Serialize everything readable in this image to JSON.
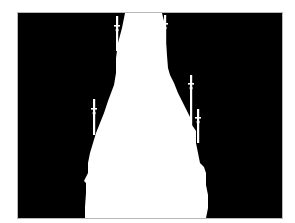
{
  "image": {
    "kind": "binary-segmentation-mask",
    "subject": "tower-spire-silhouette",
    "background_color": "#000000",
    "foreground_color": "#ffffff",
    "page_background": "#ffffff",
    "frame": {
      "x": 18,
      "y": 13,
      "width": 264,
      "height": 205
    }
  },
  "silhouette": {
    "body_path": "M107,0 L144,0 L146,8 L148,30 L150,55 L152,62 L156,70 L160,80 L164,88 L168,96 L172,104 L174,112 L178,118 L178,130 L180,140 L182,150 L186,154 L188,160 L188,172 L190,182 L190,195 L188,205 L67,205 L67,194 L68,180 L68,170 L66,168 L68,164 L70,160 L70,150 L72,140 L75,130 L78,120 L82,110 L86,100 L90,88 L93,80 L96,72 L98,60 L98,45 L100,30 L104,15 Z",
    "spires": [
      {
        "name": "left-upper-pinnacle",
        "x": 99,
        "y1": 3,
        "y2": 38,
        "cross_y": 12
      },
      {
        "name": "right-upper-pinnacle",
        "x": 147,
        "y1": 2,
        "y2": 50,
        "cross_y": 10
      },
      {
        "name": "left-lower-pinnacle",
        "x": 76,
        "y1": 86,
        "y2": 122,
        "cross_y": 95
      },
      {
        "name": "right-lower-pinnacle",
        "x": 173,
        "y1": 62,
        "y2": 112,
        "cross_y": 70
      },
      {
        "name": "right-side-pinnacle",
        "x": 180,
        "y1": 96,
        "y2": 130,
        "cross_y": 104
      }
    ]
  }
}
